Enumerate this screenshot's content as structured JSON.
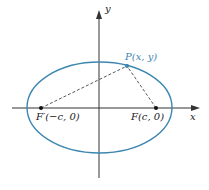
{
  "diagram": {
    "type": "ellipse-foci",
    "axes": {
      "x_label": "x",
      "y_label": "y"
    },
    "point": {
      "label": "P(x, y)"
    },
    "focus_left": {
      "label": "F′(−c, 0)"
    },
    "focus_right": {
      "label": "F(c, 0)"
    },
    "colors": {
      "ellipse": "#3c86b0",
      "axes": "#333333",
      "point_label": "#3c86b0"
    }
  }
}
